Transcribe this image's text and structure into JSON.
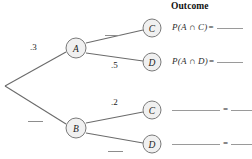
{
  "diagram": {
    "type": "probability-tree",
    "title": "",
    "root": {
      "label": "",
      "x": 5,
      "y": 86
    },
    "nodes": [
      {
        "id": "A",
        "label": "A",
        "x": 76,
        "y": 48
      },
      {
        "id": "B",
        "label": "B",
        "x": 76,
        "y": 128
      },
      {
        "id": "C1",
        "label": "C",
        "x": 152,
        "y": 28
      },
      {
        "id": "D1",
        "label": "D",
        "x": 152,
        "y": 62
      },
      {
        "id": "C2",
        "label": "C",
        "x": 152,
        "y": 110
      },
      {
        "id": "D2",
        "label": "D",
        "x": 152,
        "y": 144
      }
    ],
    "branches": [
      {
        "from": "root",
        "to": "A",
        "prob": ".3",
        "blank": false
      },
      {
        "from": "root",
        "to": "B",
        "prob": "",
        "blank": true
      },
      {
        "from": "A",
        "to": "C1",
        "prob": "",
        "blank": true
      },
      {
        "from": "A",
        "to": "D1",
        "prob": ".5",
        "blank": false
      },
      {
        "from": "B",
        "to": "C2",
        "prob": ".2",
        "blank": false
      },
      {
        "from": "B",
        "to": "D2",
        "prob": "",
        "blank": true
      }
    ]
  },
  "outcome": {
    "header": "Outcome",
    "rows": [
      {
        "formula": "P(A ∩ C)",
        "equals": "=",
        "answer": "",
        "blank_formula": false
      },
      {
        "formula": "P(A ∩ D)",
        "equals": "=",
        "answer": "",
        "blank_formula": false
      },
      {
        "formula": "",
        "equals": "=",
        "answer": "",
        "blank_formula": true
      },
      {
        "formula": "",
        "equals": "=",
        "answer": "",
        "blank_formula": true
      }
    ]
  },
  "colors": {
    "line": "#6b6b6b",
    "node_fill": "#f0f0f0",
    "node_stroke": "#7a7a7a",
    "text": "#1a1a1a",
    "blank": "#9a9a9a"
  }
}
